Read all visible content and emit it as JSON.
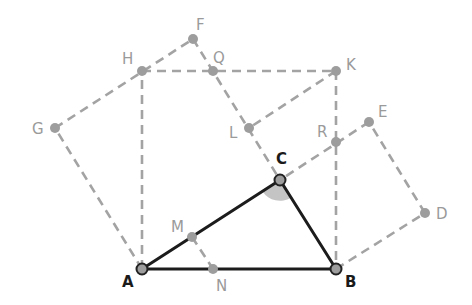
{
  "colors": {
    "solid": "#1c1c1c",
    "dashed": "#a3a3a3",
    "point_fill": "#9d9d9d",
    "point_stroke_dark": "#222222",
    "angle_fill": "#c4c4c4",
    "label_dark": "#1a1a1a",
    "label_light": "#9a9a9a"
  },
  "points": {
    "A": {
      "x": 142,
      "y": 269,
      "label": "A"
    },
    "B": {
      "x": 336,
      "y": 269,
      "label": "B"
    },
    "C": {
      "x": 280,
      "y": 180,
      "label": "C"
    },
    "D": {
      "x": 425,
      "y": 213,
      "label": "D"
    },
    "E": {
      "x": 369,
      "y": 122,
      "label": "E"
    },
    "F": {
      "x": 193,
      "y": 39,
      "label": "F"
    },
    "G": {
      "x": 55,
      "y": 128,
      "label": "G"
    },
    "H": {
      "x": 142,
      "y": 71,
      "label": "H"
    },
    "K": {
      "x": 336,
      "y": 71,
      "label": "K"
    },
    "L": {
      "x": 249,
      "y": 128,
      "label": "L"
    },
    "M": {
      "x": 192,
      "y": 237,
      "label": "M"
    },
    "N": {
      "x": 213,
      "y": 269,
      "label": "N"
    },
    "Q": {
      "x": 213,
      "y": 71,
      "label": "Q"
    },
    "R": {
      "x": 336,
      "y": 142,
      "label": "R"
    }
  },
  "triangle": [
    "A",
    "B",
    "C"
  ],
  "angle_marked": "C",
  "dashed_segments": [
    [
      "A",
      "H"
    ],
    [
      "H",
      "K"
    ],
    [
      "K",
      "B"
    ],
    [
      "A",
      "G"
    ],
    [
      "G",
      "F"
    ],
    [
      "F",
      "C"
    ],
    [
      "B",
      "D"
    ],
    [
      "D",
      "E"
    ],
    [
      "E",
      "C"
    ],
    [
      "K",
      "L"
    ],
    [
      "M",
      "N"
    ]
  ]
}
